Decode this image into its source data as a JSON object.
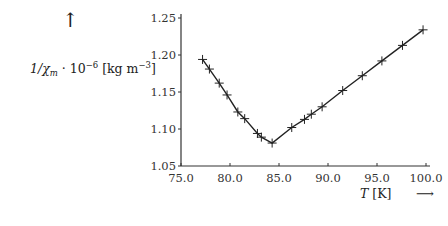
{
  "chart_data": {
    "type": "line",
    "title": "",
    "xlabel": "T [K]",
    "ylabel": "1/χm · 10^-6 [kg m^-3]",
    "xlim": [
      75.0,
      100.0
    ],
    "ylim": [
      1.05,
      1.25
    ],
    "grid": false,
    "legend": null,
    "marker": "+",
    "x_ticks": [
      "75.0",
      "80.0",
      "85.0",
      "90.0",
      "95.0",
      "100.0"
    ],
    "y_ticks": [
      "1.05",
      "1.10",
      "1.15",
      "1.20",
      "1.25"
    ],
    "series": [
      {
        "name": "1/χm",
        "x": [
          77.2,
          77.9,
          78.9,
          79.7,
          80.8,
          81.5,
          82.8,
          83.2,
          84.3,
          86.3,
          87.6,
          88.3,
          89.4,
          91.5,
          93.5,
          95.5,
          97.6,
          99.7
        ],
        "values": [
          1.194,
          1.181,
          1.162,
          1.146,
          1.123,
          1.114,
          1.094,
          1.089,
          1.081,
          1.102,
          1.113,
          1.12,
          1.13,
          1.152,
          1.172,
          1.192,
          1.213,
          1.234
        ]
      }
    ],
    "annotations": [
      "↑ (y-axis direction arrow)",
      "→ (x-axis direction arrow)"
    ]
  },
  "labels": {
    "y_label_main": "1/χ",
    "y_label_sub": "m",
    "y_label_mid": " · 10",
    "y_label_exp": "−6",
    "y_label_unit": " [kg m",
    "y_label_unit_exp": "−3",
    "y_label_close": "]",
    "x_label_var": "T",
    "x_label_unit": " [K]",
    "up_arrow": "↑",
    "right_arrow": "⟶"
  }
}
